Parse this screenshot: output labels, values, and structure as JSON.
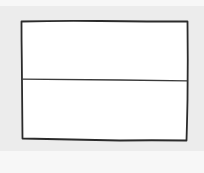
{
  "diagram": {
    "type": "wireframe-sketch",
    "colors": {
      "background": "#f7f7f7",
      "paper": "#ececec",
      "panel_fill": "#ffffff",
      "stroke": "#2b2b2b"
    },
    "outer_box": {
      "x": 21,
      "y": 21,
      "width": 167,
      "height": 119
    },
    "divider_y": 80,
    "panels": [
      {
        "id": "top-panel",
        "label": ""
      },
      {
        "id": "bottom-panel",
        "label": ""
      }
    ]
  }
}
